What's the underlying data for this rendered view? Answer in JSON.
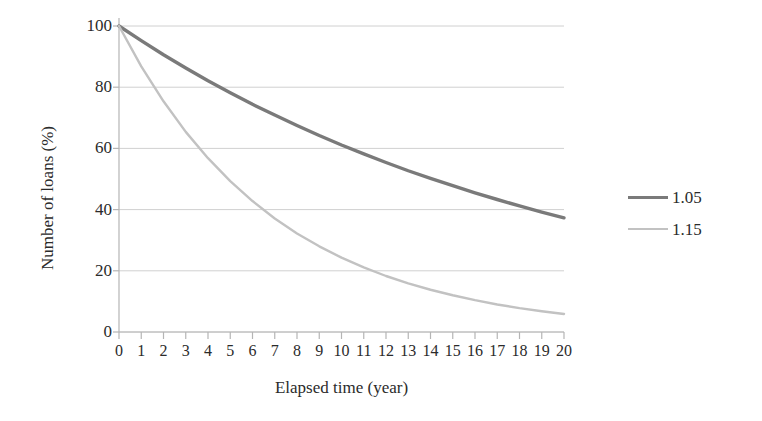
{
  "chart_data": {
    "type": "line",
    "title": "",
    "xlabel": "Elapsed time (year)",
    "ylabel": "Number of loans (%)",
    "xlim": [
      0,
      20
    ],
    "ylim": [
      0,
      100
    ],
    "grid": "horizontal",
    "legend_position": "right",
    "x_ticks": [
      "0",
      "1",
      "2",
      "3",
      "4",
      "5",
      "6",
      "7",
      "8",
      "9",
      "10",
      "11",
      "12",
      "13",
      "14",
      "15",
      "16",
      "17",
      "18",
      "19",
      "20"
    ],
    "y_ticks": [
      "0",
      "20",
      "40",
      "60",
      "80",
      "100"
    ],
    "x": [
      0,
      1,
      2,
      3,
      4,
      5,
      6,
      7,
      8,
      9,
      10,
      11,
      12,
      13,
      14,
      15,
      16,
      17,
      18,
      19,
      20
    ],
    "series": [
      {
        "name": "1.05",
        "color": "#7a7a7a",
        "values": [
          100,
          95.2,
          90.6,
          86.3,
          82.1,
          78.2,
          74.4,
          70.9,
          67.5,
          64.2,
          61.1,
          58.2,
          55.4,
          52.7,
          50.2,
          47.8,
          45.5,
          43.3,
          41.2,
          39.2,
          37.3
        ]
      },
      {
        "name": "1.15",
        "color": "#c2c2c2",
        "values": [
          100,
          86.8,
          75.4,
          65.4,
          56.8,
          49.3,
          42.8,
          37.1,
          32.2,
          28.0,
          24.3,
          21.1,
          18.3,
          15.9,
          13.8,
          12.0,
          10.4,
          9.0,
          7.8,
          6.8,
          5.9
        ]
      }
    ]
  },
  "legend": {
    "items": [
      {
        "label": "1.05"
      },
      {
        "label": "1.15"
      }
    ]
  },
  "axes": {
    "x_title": "Elapsed time (year)",
    "y_title": "Number of loans (%)"
  },
  "colors": {
    "series_1": "#7a7a7a",
    "series_2": "#c2c2c2",
    "gridline": "#d0d0d0",
    "axis": "#b5b5b5",
    "text": "#2b2b2b",
    "background": "#ffffff"
  }
}
